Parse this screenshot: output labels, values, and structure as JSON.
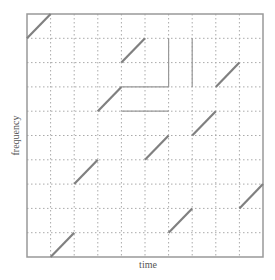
{
  "chart_data": {
    "type": "line",
    "title": "",
    "xlabel": "time",
    "ylabel": "frequency",
    "grid": true,
    "grid_cols": 10,
    "grid_rows": 10,
    "xlim": [
      0,
      10
    ],
    "ylim": [
      0,
      10
    ],
    "series": [
      {
        "name": "sweep",
        "segments": [
          [
            [
              0,
              9
            ],
            [
              1,
              10
            ]
          ],
          [
            [
              1,
              0
            ],
            [
              2,
              1
            ]
          ],
          [
            [
              2,
              3
            ],
            [
              3,
              4
            ]
          ],
          [
            [
              3,
              6
            ],
            [
              4,
              7
            ]
          ],
          [
            [
              4,
              8
            ],
            [
              5,
              9
            ]
          ],
          [
            [
              5,
              4
            ],
            [
              6,
              5
            ]
          ],
          [
            [
              6,
              1
            ],
            [
              7,
              2
            ]
          ],
          [
            [
              7,
              5
            ],
            [
              8,
              6
            ]
          ],
          [
            [
              8,
              7
            ],
            [
              9,
              8
            ]
          ],
          [
            [
              9,
              2
            ],
            [
              10,
              3
            ]
          ]
        ]
      }
    ],
    "highlight_lines": [
      [
        [
          6,
          9
        ],
        [
          6,
          7
        ]
      ],
      [
        [
          7,
          9
        ],
        [
          7,
          7
        ]
      ],
      [
        [
          4,
          7
        ],
        [
          6,
          7
        ]
      ],
      [
        [
          4,
          6
        ],
        [
          6,
          6
        ]
      ]
    ]
  },
  "colors": {
    "line": "#808080",
    "grid": "#aaaaaa",
    "frame": "#999999",
    "highlight": "#999999"
  }
}
